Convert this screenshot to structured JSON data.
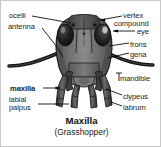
{
  "figure": {
    "title": "Maxilla",
    "subtitle": "(Grasshopper)",
    "background_color": "#ffffff",
    "border_color": "#c8c8c8",
    "text_color": "#1c1c1c"
  },
  "labels": {
    "left": [
      {
        "id": "ocelli",
        "text": "ocelli",
        "bold": false
      },
      {
        "id": "antenna",
        "text": "antenna",
        "bold": false
      },
      {
        "id": "maxilla",
        "text": "maxilla",
        "bold": true
      },
      {
        "id": "labial_palpus",
        "line1": "labial",
        "line2": "palpus",
        "bold": false
      }
    ],
    "right": [
      {
        "id": "vertex",
        "text": "vertex"
      },
      {
        "id": "compound_eye",
        "line1": "compound",
        "line2": "eye"
      },
      {
        "id": "frons",
        "text": "frons"
      },
      {
        "id": "gena",
        "text": "gena"
      },
      {
        "id": "mandible",
        "text": "mandible"
      },
      {
        "id": "clypeus",
        "text": "clypeus"
      },
      {
        "id": "labrum",
        "text": "labrum"
      }
    ]
  },
  "illustration": {
    "head_fill": "#6e6e6e",
    "head_dark": "#3a3a3a",
    "head_light": "#8d8d8d",
    "eye_fill": "#1a1a1a",
    "outline": "#222222",
    "leader_line_color": "#000000"
  }
}
